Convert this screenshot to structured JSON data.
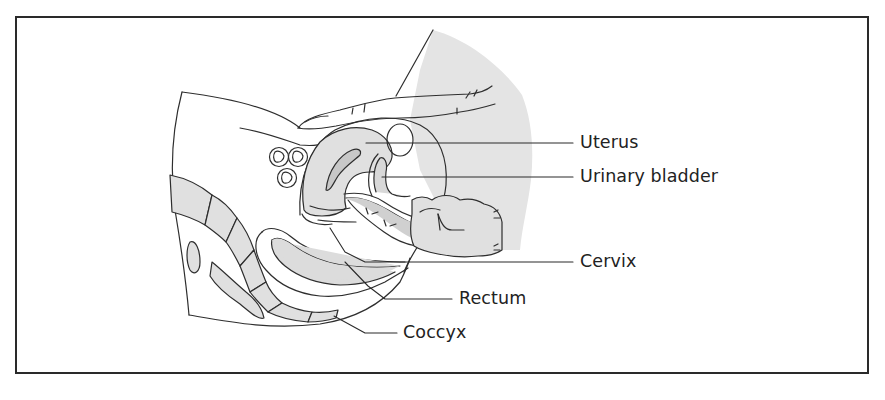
{
  "figure": {
    "type": "anatomical-diagram",
    "colors": {
      "outline": "#2e2e2e",
      "fill_tissue": "#e2e2e2",
      "background": "#ffffff",
      "frame_border": "#2a2a2a",
      "label_text": "#222222"
    }
  },
  "labels": [
    {
      "id": "uterus",
      "text": "Uterus"
    },
    {
      "id": "urinary-bladder",
      "text": "Urinary bladder"
    },
    {
      "id": "cervix",
      "text": "Cervix"
    },
    {
      "id": "rectum",
      "text": "Rectum"
    },
    {
      "id": "coccyx",
      "text": "Coccyx"
    }
  ]
}
